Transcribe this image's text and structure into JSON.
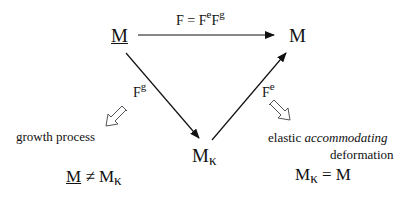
{
  "nodes": {
    "reference": {
      "base": "M"
    },
    "current": {
      "base": "M"
    },
    "intermediate": {
      "base": "M",
      "sub": "κ"
    }
  },
  "arrows": {
    "total": {
      "lhs": "F",
      "eq": " = ",
      "f1": "F",
      "f1sup": "e",
      "f2": "F",
      "f2sup": "g"
    },
    "growth": {
      "base": "F",
      "sup": "g"
    },
    "elastic": {
      "base": "F",
      "sup": "e"
    }
  },
  "annotations": {
    "growth_process": "growth process",
    "elastic_prefix": "elastic ",
    "elastic_italic": "accommodating",
    "elastic_line2": "deformation"
  },
  "relations": {
    "left": {
      "a": "M",
      "op": " ≠ ",
      "b": "M",
      "bsub": "κ"
    },
    "right": {
      "a": "M",
      "asub": "κ",
      "op": " = ",
      "b": "M"
    }
  }
}
